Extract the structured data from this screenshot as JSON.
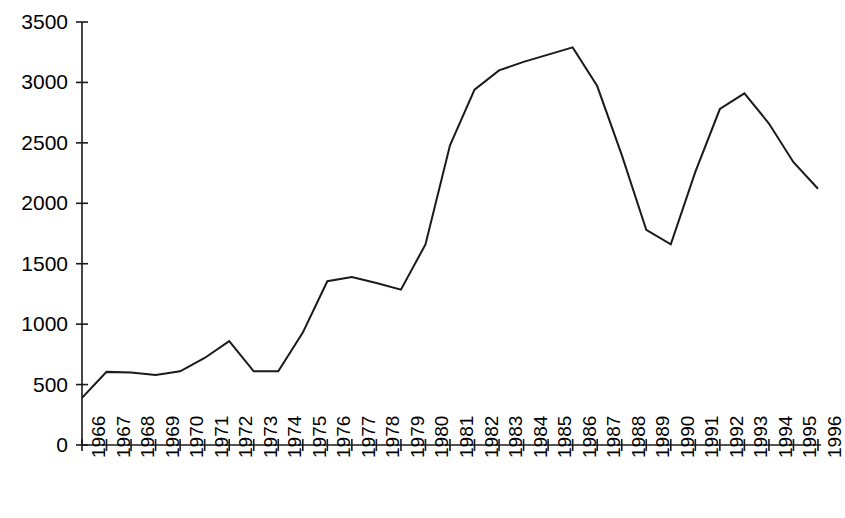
{
  "chart_data": {
    "type": "line",
    "title": "",
    "subtitle": "",
    "xlabel": "",
    "ylabel": "",
    "grid": false,
    "legend": null,
    "legend_position": "none",
    "line_color": "#1a1a1a",
    "axis_color": "#1a1a1a",
    "background_color": "#ffffff",
    "xlim": [
      1966,
      1996
    ],
    "ylim": [
      0,
      3500
    ],
    "ytick_values": [
      0,
      500,
      1000,
      1500,
      2000,
      2500,
      3000,
      3500
    ],
    "ytick_labels": [
      "0",
      "500",
      "1000",
      "1500",
      "2000",
      "2500",
      "3000",
      "3500"
    ],
    "xtick_labels": [
      "1966",
      "1967",
      "1968",
      "1969",
      "1970",
      "1971",
      "1972",
      "1973",
      "1974",
      "1975",
      "1976",
      "1977",
      "1978",
      "1979",
      "1980",
      "1981",
      "1982",
      "1983",
      "1984",
      "1985",
      "1986",
      "1987",
      "1988",
      "1989",
      "1990",
      "1991",
      "1992",
      "1993",
      "1994",
      "1995",
      "1996"
    ],
    "categories": [
      1966,
      1967,
      1968,
      1969,
      1970,
      1971,
      1972,
      1973,
      1974,
      1975,
      1976,
      1977,
      1978,
      1979,
      1980,
      1981,
      1982,
      1983,
      1984,
      1985,
      1986,
      1987,
      1988,
      1989,
      1990,
      1991,
      1992,
      1993,
      1994,
      1995,
      1996
    ],
    "values": [
      390,
      605,
      600,
      580,
      610,
      720,
      860,
      610,
      610,
      930,
      1355,
      1390,
      1340,
      1285,
      1660,
      2480,
      2940,
      3100,
      3170,
      3230,
      3290,
      2970,
      2400,
      1780,
      1660,
      2260,
      2780,
      2910,
      2660,
      2340,
      2120
    ],
    "series": [
      {
        "name": "series-1",
        "values": [
          390,
          605,
          600,
          580,
          610,
          720,
          860,
          610,
          610,
          930,
          1355,
          1390,
          1340,
          1285,
          1660,
          2480,
          2940,
          3100,
          3170,
          3230,
          3290,
          2970,
          2400,
          1780,
          1660,
          2260,
          2780,
          2910,
          2660,
          2340,
          2120
        ]
      }
    ]
  }
}
